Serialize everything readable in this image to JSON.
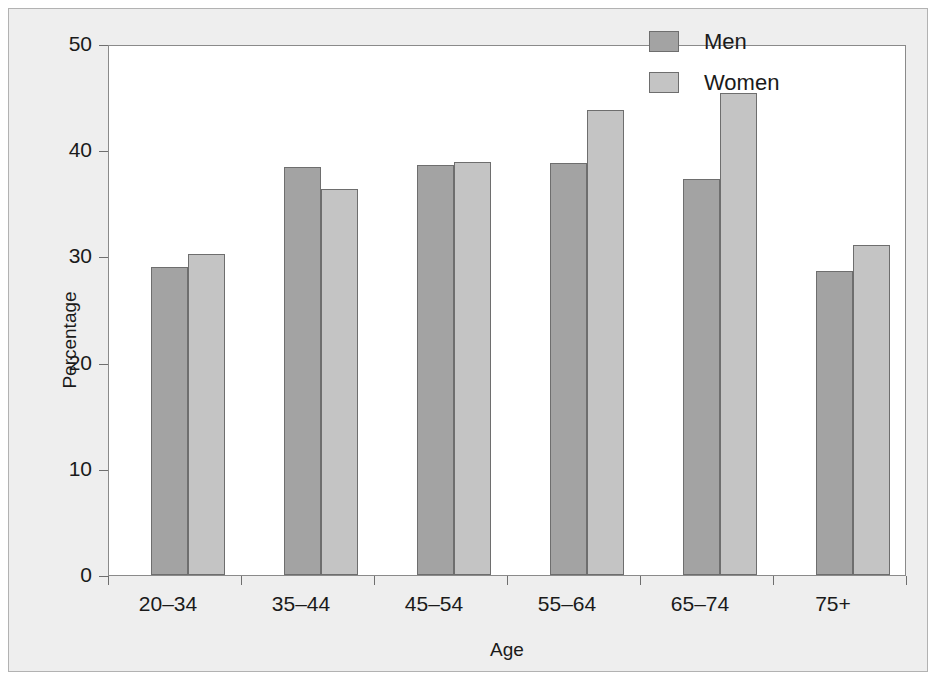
{
  "chart_data": {
    "type": "bar",
    "title": "",
    "xlabel": "Age",
    "ylabel": "Percentage",
    "categories": [
      "20–34",
      "35–44",
      "45–54",
      "55–64",
      "65–74",
      "75+"
    ],
    "series": [
      {
        "name": "Men",
        "color": "#a3a3a3",
        "values": [
          29.0,
          38.4,
          38.6,
          38.8,
          37.3,
          28.6
        ]
      },
      {
        "name": "Women",
        "color": "#c4c4c4",
        "values": [
          30.2,
          36.3,
          38.9,
          43.8,
          45.4,
          31.1
        ]
      }
    ],
    "ylim": [
      0,
      50
    ],
    "yticks": [
      0,
      10,
      20,
      30,
      40,
      50
    ],
    "ytick_labels": [
      "0",
      "10",
      "20",
      "30",
      "40",
      "50"
    ],
    "grid": false,
    "legend_position": "top-right"
  },
  "legend": {
    "entries": [
      {
        "label": "Men",
        "swatch": "men-swatch"
      },
      {
        "label": "Women",
        "swatch": "women-swatch"
      }
    ]
  }
}
